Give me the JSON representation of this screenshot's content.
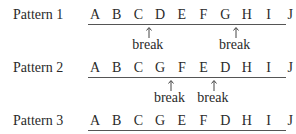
{
  "patterns": [
    {
      "label": "Pattern 1",
      "letters": [
        "A",
        "B",
        "C",
        "D",
        "E",
        "F",
        "G",
        "H",
        "I",
        "J"
      ],
      "breaks": [
        {
          "after_index": 2,
          "text": "break"
        },
        {
          "after_index": 6,
          "text": "break"
        }
      ]
    },
    {
      "label": "Pattern 2",
      "letters": [
        "A",
        "B",
        "C",
        "G",
        "F",
        "E",
        "D",
        "H",
        "I",
        "J"
      ],
      "breaks": [
        {
          "after_index": 3,
          "text": "break"
        },
        {
          "after_index": 5,
          "text": "break"
        }
      ]
    },
    {
      "label": "Pattern 3",
      "letters": [
        "A",
        "B",
        "C",
        "G",
        "E",
        "F",
        "D",
        "H",
        "I",
        "J"
      ],
      "breaks": []
    }
  ]
}
